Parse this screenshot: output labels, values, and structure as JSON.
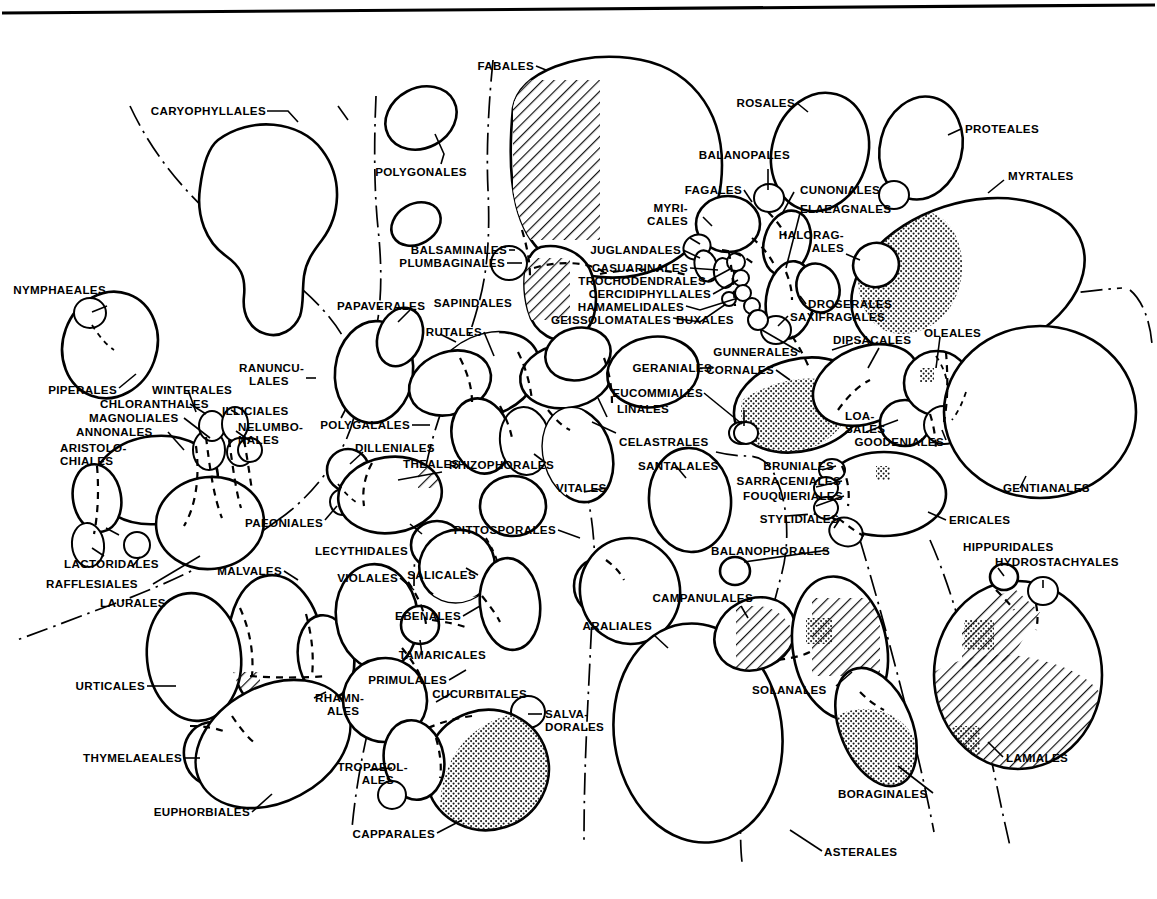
{
  "figure": {
    "type": "phylogenetic-bubble-diagram",
    "background_color": "#ffffff",
    "line_color": "#000000",
    "fill_patterns": [
      "plain",
      "stipple",
      "hatch"
    ],
    "top_rule": true
  },
  "labels": {
    "caryophyllales": "CARYOPHYLLALES",
    "polygonales": "POLYGONALES",
    "balsaminales": "BALSAMINALES",
    "plumbaginales": "PLUMBAGINALES",
    "fabales": "FABALES",
    "rosales": "ROSALES",
    "balanopales": "BALANOPALES",
    "proteales": "PROTEALES",
    "myrtales": "MYRTALES",
    "fagales": "FAGALES",
    "myricales_1": "MYRI-",
    "myricales_2": "CALES",
    "cunoniales": "CUNONIALES",
    "elaeagnales": "ELAEAGNALES",
    "haloragales_1": "HALORAG-",
    "haloragales_2": "ALES",
    "juglandales": "JUGLANDALES",
    "casuarinales": "CASUARINALES",
    "trochodendrales": "TROCHODENDRALES",
    "cercidiphyllales": "CERCIDIPHYLLALES",
    "hamamelidales": "HAMAMELIDALES",
    "geissolomatales": "GEISSOLOMATALES",
    "buxales": "BUXALES",
    "droserales": "DROSERALES",
    "saxifragales": "SAXIFRAGALES",
    "gunnerales": "GUNNERALES",
    "cornales": "CORNALES",
    "dipsacales": "DIPSACALES",
    "oleales": "OLEALES",
    "loasales_1": "LOA-",
    "loasales_2": "SALES",
    "goodeniales": "GOODENIALES",
    "gentianales": "GENTIANALES",
    "nymphaeales": "NYMPHAEALES",
    "piperales": "PIPERALES",
    "winterales": "WINTERALES",
    "chloranthales": "CHLORANTHALES",
    "magnoliales": "MAGNOLIALES",
    "annonales": "ANNONALES",
    "illiciales": "ILLICIALES",
    "aristolochiales_1": "ARISTOLO-",
    "aristolochiales_2": "CHIALES",
    "nelumbonales_1": "NELUMBO-",
    "nelumbonales_2": "NALES",
    "ranunculales_1": "RANUNCU-",
    "ranunculales_2": "LALES",
    "papaverales": "PAPAVERALES",
    "sapindales": "SAPINDALES",
    "rutales": "RUTALES",
    "polygalales": "POLYGALALES",
    "dilleniales": "DILLENIALES",
    "theales": "THEALES",
    "rhizophorales": "RHIZOPHORALES",
    "linales": "LINALES",
    "celastrales": "CELASTRALES",
    "geraniales": "GERANIALES",
    "eucommiales": "EUCOMMIALES",
    "santalales": "SANTALALES",
    "bruniales": "BRUNIALES",
    "sarraceniales": "SARRACENIALES",
    "fouquieriales": "FOUQUIERIALES",
    "stylidiales": "STYLIDIALES",
    "ericales": "ERICALES",
    "vitales": "VITALES",
    "paeoniales": "PAEONIALES",
    "lecythidales": "LECYTHIDALES",
    "pittosporales": "PITTOSPORALES",
    "balanophorales": "BALANOPHORALES",
    "hippuridales": "HIPPURIDALES",
    "hydrostachyales": "HYDROSTACHYALES",
    "lactoridales": "LACTORIDALES",
    "rafflesiales": "RAFFLESIALES",
    "laurales": "LAURALES",
    "malvales": "MALVALES",
    "violales": "VIOLALES",
    "salicales": "SALICALES",
    "ebenales": "EBENALES",
    "tamaricales": "TAMARICALES",
    "primulales": "PRIMULALES",
    "cucurbitales": "CUCURBITALES",
    "salvadorales_1": "SALVA-",
    "salvadorales_2": "DORALES",
    "campanulales": "CAMPANULALES",
    "araliales": "ARALIALES",
    "solanales": "SOLANALES",
    "urticales": "URTICALES",
    "rhamnales_1": "RHAMN-",
    "rhamnales_2": "ALES",
    "thymelaeales": "THYMELAEALES",
    "euphorbiales": "EUPHORBIALES",
    "tropaeolales_1": "TROPAEOL-",
    "tropaeolales_2": "ALES",
    "capparales": "CAPPARALES",
    "asterales": "ASTERALES",
    "boraginales": "BORAGINALES",
    "lamiales": "LAMIALES"
  }
}
